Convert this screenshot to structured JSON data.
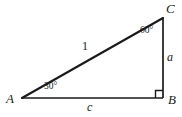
{
  "figure": {
    "kind": "geometry-diagram",
    "background_color": "#ffffff",
    "stroke_color": "#1a1a1a"
  },
  "vertices": {
    "a": {
      "label": "A",
      "x": 22,
      "y": 98
    },
    "b": {
      "label": "B",
      "x": 163,
      "y": 98
    },
    "c": {
      "label": "C",
      "x": 163,
      "y": 18
    }
  },
  "sides": {
    "hypotenuse": {
      "label": "1"
    },
    "vertical_leg": {
      "label": "a"
    },
    "base": {
      "label": "c"
    }
  },
  "angles": {
    "at_a": {
      "label": "30°"
    },
    "at_c": {
      "label": "60°"
    },
    "at_b": {
      "label": "right-angle-marker"
    }
  }
}
